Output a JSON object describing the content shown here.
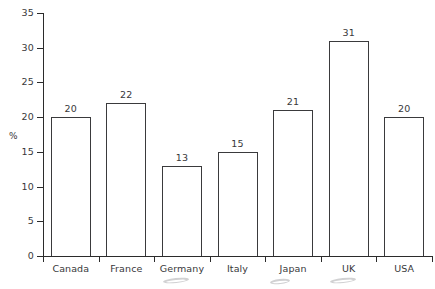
{
  "chart_data": {
    "type": "bar",
    "title": "",
    "subtitle": "",
    "xlabel": "",
    "ylabel": "%",
    "ylim": [
      0,
      35
    ],
    "ytick_step": 5,
    "grid": false,
    "legend": "none",
    "categories": [
      "Canada",
      "France",
      "Germany",
      "Italy",
      "Japan",
      "UK",
      "USA"
    ],
    "values": [
      20,
      22,
      13,
      15,
      21,
      31,
      20
    ],
    "value_labels": [
      "20",
      "22",
      "13",
      "15",
      "21",
      "31",
      "20"
    ],
    "ytick_labels": [
      "0",
      "5",
      "10",
      "15",
      "20",
      "25",
      "30",
      "35"
    ],
    "ytick_values": [
      0,
      5,
      10,
      15,
      20,
      25,
      30,
      35
    ],
    "bar_style": {
      "fill": "#ffffff",
      "outline": "#3a3a3c"
    },
    "axis_color": "#2b2b2b",
    "text_color": "#38383a",
    "background": "#ffffff"
  }
}
